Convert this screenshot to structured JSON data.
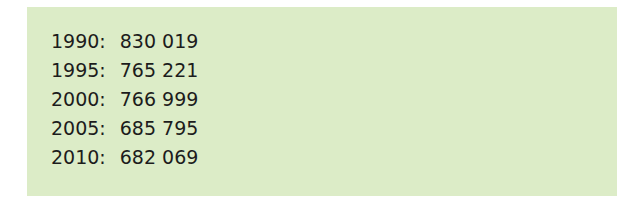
{
  "panel": {
    "background": "#dcecc7",
    "rows": [
      {
        "year": "1990:",
        "value": "830 019"
      },
      {
        "year": "1995:",
        "value": "765 221"
      },
      {
        "year": "2000:",
        "value": "766 999"
      },
      {
        "year": "2005:",
        "value": "685 795"
      },
      {
        "year": "2010:",
        "value": "682 069"
      }
    ]
  }
}
